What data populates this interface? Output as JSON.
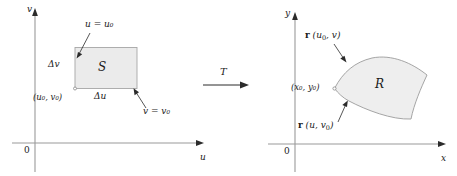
{
  "figure": {
    "colors": {
      "axis": "#8c8c8c",
      "outline": "#9a9a9a",
      "fill": "#ebebeb",
      "text": "#1a1a1a",
      "leader": "#2b2b2b"
    }
  },
  "left_panel": {
    "name": "uv-plane",
    "axes": {
      "x_label": "u",
      "y_label": "v",
      "origin_label": "0"
    },
    "region_label": "S",
    "annotations": {
      "top_edge": {
        "text": "u = u₀",
        "base": "u",
        "equals": "=",
        "var": "u",
        "sub": "0"
      },
      "bottom_edge": {
        "text": "v = v₀",
        "base": "v",
        "equals": "=",
        "var": "v",
        "sub": "0"
      },
      "corner_point": {
        "text": "(u₀, v₀)",
        "open": "(",
        "v1": "u",
        "s1": "0",
        "comma": ", ",
        "v2": "v",
        "s2": "0",
        "close": ")"
      },
      "width_label": {
        "text": "Δu",
        "delta": "Δ",
        "var": "u"
      },
      "height_label": {
        "text": "Δv",
        "delta": "Δ",
        "var": "v"
      }
    }
  },
  "middle": {
    "map_label": "T",
    "arrow": "arrow-right"
  },
  "right_panel": {
    "name": "xy-plane",
    "axes": {
      "x_label": "x",
      "y_label": "y",
      "origin_label": "0"
    },
    "region_label": "R",
    "annotations": {
      "top_curve": {
        "text": "r (u₀, v)",
        "bold": "r",
        "open": " (",
        "v1": "u",
        "s1": "0",
        "comma": ", ",
        "v2": "v",
        "close": ")"
      },
      "bottom_curve": {
        "text": "r (u, v₀)",
        "bold": "r",
        "open": " (",
        "v1": "u",
        "comma": ", ",
        "v2": "v",
        "s2": "0",
        "close": ")"
      },
      "corner_point": {
        "text": "(x₀, y₀)",
        "open": "(",
        "v1": "x",
        "s1": "0",
        "comma": ", ",
        "v2": "y",
        "s2": "0",
        "close": ")"
      }
    }
  }
}
